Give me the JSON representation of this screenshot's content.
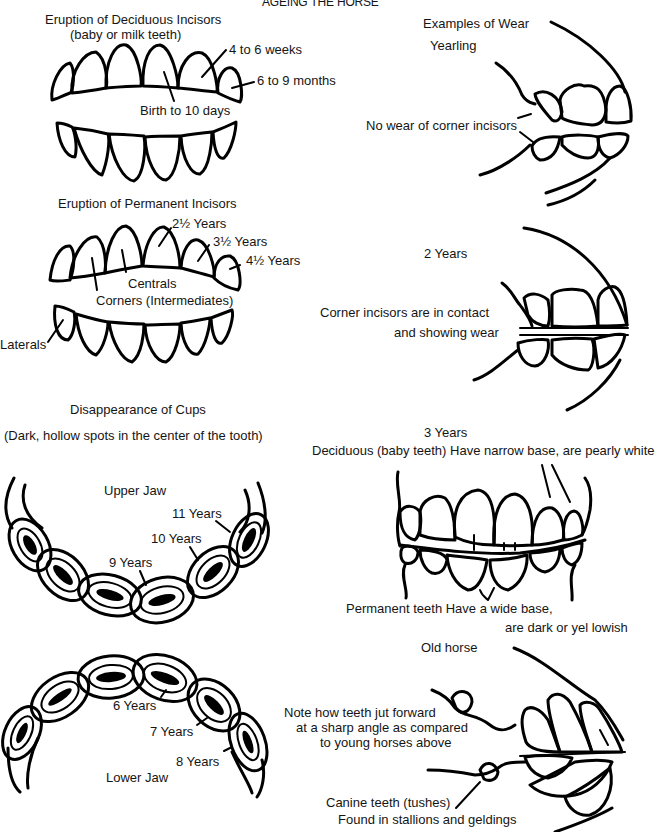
{
  "title": "AGEING THE HORSE",
  "sections": {
    "deciduous": {
      "heading": "Eruption of Deciduous Incisors",
      "subheading": "(baby or milk teeth)",
      "labels": [
        "4 to 6 weeks",
        "6 to 9 months",
        "Birth to 10 days"
      ]
    },
    "permanent": {
      "heading": "Eruption of Permanent Incisors",
      "labels": [
        "2½ Years",
        "3½ Years",
        "4½ Years",
        "Centrals",
        "Corners (Intermediates)",
        "Laterals"
      ]
    },
    "cups": {
      "heading": "Disappearance of Cups",
      "subheading": "(Dark, hollow spots in the center of the tooth)",
      "upper_jaw": {
        "label": "Upper Jaw",
        "ages": [
          "11 Years",
          "10 Years",
          "9 Years"
        ]
      },
      "lower_jaw": {
        "label": "Lower Jaw",
        "ages": [
          "6 Years",
          "7 Years",
          "8 Years"
        ]
      }
    },
    "wear": {
      "heading": "Examples of Wear",
      "yearling": {
        "label": "Yearling",
        "note": "No wear of corner incisors"
      },
      "two_years": {
        "label": "2 Years",
        "note_line1": "Corner incisors are in contact",
        "note_line2": "and showing wear"
      },
      "three_years": {
        "label": "3 Years",
        "deciduous_note": "Deciduous (baby teeth) Have narrow base, are pearly white",
        "permanent_note_line1": "Permanent teeth Have a wide base,",
        "permanent_note_line2": "are dark or yel lowish"
      },
      "old_horse": {
        "label": "Old horse",
        "note_line1": "Note how teeth jut forward",
        "note_line2": "at a sharp angle as compared",
        "note_line3": "to young horses above",
        "canine_line1": "Canine teeth (tushes)",
        "canine_line2": "Found in stallions and geldings"
      }
    }
  }
}
